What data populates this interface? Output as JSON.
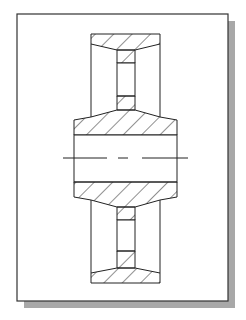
{
  "figure": {
    "title": "",
    "colors": {
      "background": "#ffffff",
      "frame_stroke": "#333333",
      "shadow": "#a8a8a8",
      "line": "#222222",
      "centerline": "#222222"
    },
    "frame": {
      "x": 17,
      "y": 14,
      "width": 211,
      "height": 287,
      "shadow_offset": 7
    },
    "parts": [
      "rim-top",
      "web-top",
      "hub",
      "bore",
      "web-bottom",
      "rim-bottom",
      "centerline"
    ],
    "hatch": {
      "angle_deg": 45,
      "spacing": 13
    },
    "centerline": {
      "y": 158,
      "dashes": [
        [
          63,
          107
        ],
        [
          118,
          128
        ],
        [
          142,
          188
        ]
      ]
    }
  }
}
